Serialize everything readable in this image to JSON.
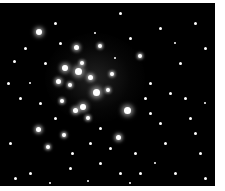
{
  "image": {
    "subject": "star cluster",
    "background": "#000000",
    "stars": [
      [
        39,
        29,
        3
      ],
      [
        100,
        43,
        2
      ],
      [
        76,
        44,
        2.5
      ],
      [
        65,
        65,
        3
      ],
      [
        78,
        68,
        3.5
      ],
      [
        90,
        74,
        2.5
      ],
      [
        82,
        60,
        2
      ],
      [
        58,
        78,
        2.5
      ],
      [
        96,
        89,
        3.5
      ],
      [
        83,
        104,
        3
      ],
      [
        75,
        107,
        2.5
      ],
      [
        127,
        107,
        3.5
      ],
      [
        108,
        87,
        2
      ],
      [
        112,
        71,
        2
      ],
      [
        70,
        82,
        2
      ],
      [
        62,
        98,
        2
      ],
      [
        88,
        115,
        2
      ],
      [
        118,
        134,
        2.5
      ],
      [
        38,
        126,
        2.5
      ],
      [
        64,
        132,
        2
      ],
      [
        48,
        144,
        2
      ],
      [
        140,
        53,
        2
      ],
      [
        150,
        80,
        1.5
      ],
      [
        170,
        90,
        1.5
      ],
      [
        180,
        60,
        1.5
      ],
      [
        190,
        115,
        1.5
      ],
      [
        200,
        150,
        1.5
      ],
      [
        165,
        140,
        1.5
      ],
      [
        135,
        150,
        1.5
      ],
      [
        100,
        160,
        1.5
      ],
      [
        70,
        165,
        1.5
      ],
      [
        30,
        170,
        1.5
      ],
      [
        14,
        58,
        1.5
      ],
      [
        20,
        95,
        1.5
      ],
      [
        10,
        140,
        1.5
      ],
      [
        25,
        45,
        1.5
      ],
      [
        55,
        20,
        1.5
      ],
      [
        120,
        10,
        1.5
      ],
      [
        160,
        25,
        1.5
      ],
      [
        195,
        20,
        1.5
      ],
      [
        205,
        45,
        1.5
      ],
      [
        185,
        95,
        1.5
      ],
      [
        150,
        110,
        1.5
      ],
      [
        140,
        170,
        1.5
      ],
      [
        110,
        145,
        1.5
      ],
      [
        90,
        140,
        1.5
      ],
      [
        45,
        60,
        1.5
      ],
      [
        40,
        100,
        1.5
      ],
      [
        160,
        120,
        1.5
      ],
      [
        175,
        170,
        1.5
      ],
      [
        205,
        175,
        1.5
      ],
      [
        15,
        175,
        1.5
      ],
      [
        60,
        40,
        1.5
      ],
      [
        130,
        35,
        1.5
      ],
      [
        145,
        95,
        1.5
      ],
      [
        100,
        125,
        1.5
      ],
      [
        55,
        115,
        1.5
      ],
      [
        72,
        150,
        1.5
      ],
      [
        120,
        170,
        1.5
      ],
      [
        195,
        130,
        1.5
      ],
      [
        8,
        80,
        1.5
      ],
      [
        30,
        80,
        1.2
      ],
      [
        175,
        40,
        1.2
      ],
      [
        155,
        160,
        1.2
      ],
      [
        115,
        55,
        1.2
      ],
      [
        95,
        30,
        1.2
      ],
      [
        50,
        180,
        1.2
      ],
      [
        88,
        178,
        1.2
      ],
      [
        130,
        180,
        1.2
      ],
      [
        205,
        100,
        1.2
      ]
    ]
  }
}
